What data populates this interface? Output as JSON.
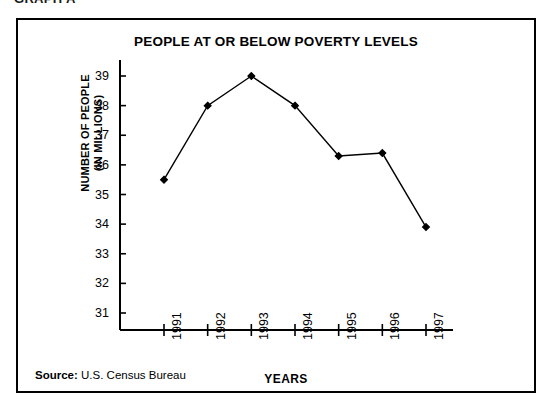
{
  "graph_caption": "GRAPH A",
  "source": {
    "label": "Source:",
    "text": "U.S. Census Bureau"
  },
  "chart_data": {
    "type": "line",
    "title": "PEOPLE AT OR BELOW POVERTY LEVELS",
    "xlabel": "YEARS",
    "ylabel": "NUMBER OF PEOPLE\n(IN MILLIONS)",
    "categories": [
      "1991",
      "1992",
      "1993",
      "1994",
      "1995",
      "1996",
      "1997"
    ],
    "values": [
      35.5,
      38.0,
      39.0,
      38.0,
      36.3,
      36.4,
      33.9
    ],
    "ylim": [
      31,
      39
    ],
    "yticks": [
      "39",
      "38",
      "37",
      "36",
      "35",
      "34",
      "33",
      "32",
      "31"
    ],
    "ytick_values": [
      39,
      38,
      37,
      36,
      35,
      34,
      33,
      32,
      31
    ],
    "grid": false,
    "legend": "none",
    "marker": "filled-diamond",
    "line_color": "#000000",
    "marker_color": "#000000",
    "background": "#ffffff"
  }
}
